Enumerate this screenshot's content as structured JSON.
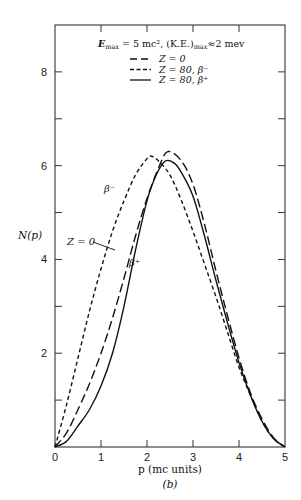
{
  "chart_data": {
    "type": "line",
    "subtitle": "(b)",
    "xlabel": "p (mc units)",
    "ylabel": "N(p)",
    "xlim": [
      0,
      5
    ],
    "ylim": [
      0,
      9
    ],
    "grid": false,
    "legend_position": "top-right inside",
    "x_ticks": [
      0,
      1,
      2,
      3,
      4,
      5
    ],
    "x_tick_labels": [
      "0",
      "1",
      "2",
      "3",
      "4",
      "5"
    ],
    "y_ticks": [
      0,
      1,
      2,
      3,
      4,
      5,
      6,
      7,
      8
    ],
    "y_tick_labels": [
      "",
      "",
      "2",
      "",
      "4",
      "",
      "6",
      "",
      "8"
    ],
    "series": [
      {
        "name": "Z = 0",
        "style": "long-dash",
        "x": [
          0,
          0.25,
          0.5,
          0.75,
          1.0,
          1.25,
          1.5,
          1.75,
          2.0,
          2.25,
          2.45,
          2.75,
          3.0,
          3.25,
          3.5,
          3.75,
          4.0,
          4.25,
          4.5,
          4.75,
          5.0
        ],
        "values": [
          0,
          0.3,
          0.8,
          1.35,
          2.0,
          2.75,
          3.6,
          4.5,
          5.3,
          5.95,
          6.3,
          6.1,
          5.6,
          4.75,
          3.75,
          2.8,
          1.9,
          1.15,
          0.6,
          0.2,
          0
        ]
      },
      {
        "name": "Z = 80, β⁻",
        "style": "short-dash",
        "x": [
          0,
          0.25,
          0.5,
          0.75,
          1.0,
          1.25,
          1.5,
          1.75,
          2.0,
          2.1,
          2.25,
          2.5,
          2.75,
          3.0,
          3.25,
          3.5,
          3.75,
          4.0,
          4.25,
          4.5,
          4.75,
          5.0
        ],
        "values": [
          0,
          0.9,
          1.9,
          2.9,
          3.8,
          4.6,
          5.25,
          5.8,
          6.15,
          6.2,
          6.1,
          5.8,
          5.25,
          4.6,
          3.9,
          3.2,
          2.45,
          1.7,
          1.1,
          0.55,
          0.18,
          0
        ]
      },
      {
        "name": "Z = 80, β⁺",
        "style": "solid",
        "x": [
          0,
          0.25,
          0.5,
          0.75,
          1.0,
          1.25,
          1.5,
          1.75,
          2.0,
          2.2,
          2.4,
          2.6,
          2.75,
          3.0,
          3.25,
          3.5,
          3.75,
          4.0,
          4.25,
          4.5,
          4.75,
          5.0
        ],
        "values": [
          0,
          0.12,
          0.45,
          0.8,
          1.3,
          2.0,
          3.0,
          4.2,
          5.25,
          5.8,
          6.1,
          6.05,
          5.85,
          5.35,
          4.5,
          3.55,
          2.65,
          1.8,
          1.1,
          0.55,
          0.18,
          0
        ]
      }
    ],
    "annotations": [
      {
        "text": "β⁻",
        "x": 1.23,
        "y": 5.55
      },
      {
        "text": "Z = 0",
        "x": 0.55,
        "y": 4.4,
        "arrow_to": [
          1.33,
          4.2
        ]
      },
      {
        "text": "β⁺",
        "x": 1.7,
        "y": 3.9
      }
    ]
  },
  "legend": {
    "header_main": "E",
    "header_sub1": "max",
    "header_mid": " = 5 mc², (K.E.)",
    "header_sub2": "max",
    "header_tail": "≈2 mev",
    "items": [
      {
        "label": "Z = 0",
        "style": "long-dash"
      },
      {
        "label": "Z = 80, β⁻",
        "style": "short-dash"
      },
      {
        "label": "Z = 80, β⁺",
        "style": "solid"
      }
    ]
  },
  "labels": {
    "ylabel": "N(p)",
    "xlabel": "p (mc units)",
    "panel": "(b)",
    "beta_minus": "β⁻",
    "z0": "Z = 0",
    "beta_plus": "β⁺"
  }
}
